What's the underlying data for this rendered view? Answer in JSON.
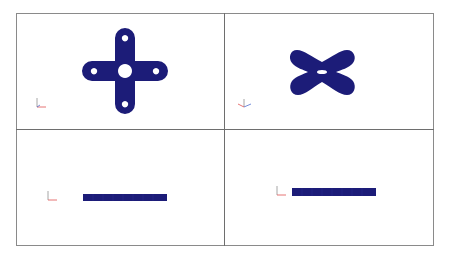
{
  "layout": {
    "frame_color": "#8a8a8a",
    "divider_color": "#6e6e6e",
    "background": "#ffffff"
  },
  "part_color": "#1c1c78",
  "viewports": [
    {
      "name": "top-left",
      "view": "front",
      "shape": "cross-plate-with-holes",
      "triad": {
        "axes": [
          "y",
          "x"
        ]
      }
    },
    {
      "name": "top-right",
      "view": "isometric",
      "shape": "cross-plate-oblique",
      "triad": {
        "axes": [
          "y",
          "x",
          "z"
        ]
      }
    },
    {
      "name": "bottom-left",
      "view": "edge",
      "shape": "thin-bar",
      "triad": {
        "axes": [
          "y",
          "x"
        ]
      }
    },
    {
      "name": "bottom-right",
      "view": "edge",
      "shape": "thin-bar",
      "triad": {
        "axes": [
          "y",
          "x"
        ]
      }
    }
  ],
  "triad_colors": {
    "x": "#e05050",
    "y": "#909090",
    "z": "#5070d0"
  }
}
